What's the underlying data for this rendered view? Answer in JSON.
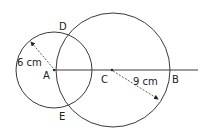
{
  "diagram": {
    "type": "two-intersecting-circles",
    "stroke_color": "#3a3a3a",
    "points": {
      "A": "A",
      "B": "B",
      "C": "C",
      "D": "D",
      "E": "E"
    },
    "small_circle": {
      "center": "A",
      "radius_label": "6 cm"
    },
    "large_circle": {
      "center": "C",
      "radius_label": "9 cm"
    }
  }
}
